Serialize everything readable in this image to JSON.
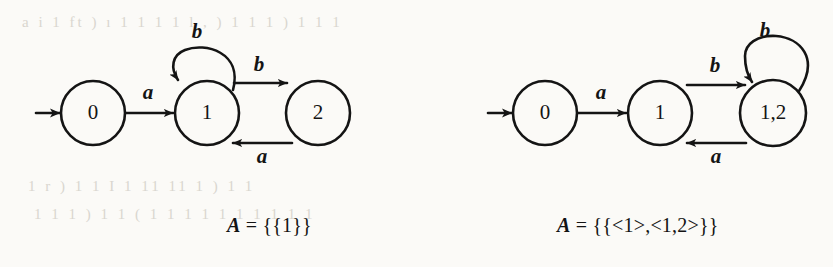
{
  "figure": {
    "background_color": "#fbfaf7",
    "ink_color": "#141414",
    "bleed_through_lines": [
      "a i 1 ft  ) ı 1  1 1 1 l  , ) 1 1 1 )  1 1   1",
      "1 r )  1 1    I  1 11 11 1  ) 1  1",
      "1 1 1 ) 1  1  ( 1 1 1 1   1  1 1 1  1  1"
    ]
  },
  "diagrams": [
    {
      "id": "nfa-left",
      "name": "left-automaton",
      "caption": {
        "variable": "A",
        "equals": "=",
        "value": "{{1}}",
        "full_text": "A = {{1}}"
      },
      "start_arrow": {
        "name": "start-arrow",
        "label": ""
      },
      "states": [
        {
          "id": "s0",
          "label": "0",
          "cx": 93,
          "cy": 113,
          "r": 32
        },
        {
          "id": "s1",
          "label": "1",
          "cx": 207,
          "cy": 113,
          "r": 32
        },
        {
          "id": "s2",
          "label": "2",
          "cx": 318,
          "cy": 113,
          "r": 32
        }
      ],
      "transitions": [
        {
          "from": "s0",
          "to": "s1",
          "label": "a",
          "kind": "straight",
          "label_x": 148,
          "label_y": 94
        },
        {
          "from": "s1",
          "to": "s1",
          "label": "b",
          "kind": "self-loop",
          "label_x": 197,
          "label_y": 33
        },
        {
          "from": "s1",
          "to": "s2",
          "label": "b",
          "kind": "straight",
          "label_x": 259,
          "label_y": 66
        },
        {
          "from": "s2",
          "to": "s1",
          "label": "a",
          "kind": "straight",
          "label_x": 262,
          "label_y": 158
        }
      ]
    },
    {
      "id": "dfa-right",
      "name": "right-automaton",
      "caption": {
        "variable": "A",
        "equals": "=",
        "value": "{{<1>,<1,2>}}",
        "full_text": "A = {{<1>,<1,2>}}"
      },
      "start_arrow": {
        "name": "start-arrow",
        "label": ""
      },
      "states": [
        {
          "id": "r0",
          "label": "0",
          "cx": 545,
          "cy": 113,
          "r": 32
        },
        {
          "id": "r1",
          "label": "1",
          "cx": 660,
          "cy": 113,
          "r": 32
        },
        {
          "id": "r12",
          "label": "1,2",
          "cx": 773,
          "cy": 113,
          "r": 33
        }
      ],
      "transitions": [
        {
          "from": "r0",
          "to": "r1",
          "label": "a",
          "kind": "straight",
          "label_x": 601,
          "label_y": 94
        },
        {
          "from": "r1",
          "to": "r12",
          "label": "b",
          "kind": "straight",
          "label_x": 715,
          "label_y": 67
        },
        {
          "from": "r12",
          "to": "r1",
          "label": "a",
          "kind": "straight",
          "label_x": 716,
          "label_y": 158
        },
        {
          "from": "r12",
          "to": "r12",
          "label": "b",
          "kind": "self-loop",
          "label_x": 765,
          "label_y": 32
        }
      ]
    }
  ]
}
